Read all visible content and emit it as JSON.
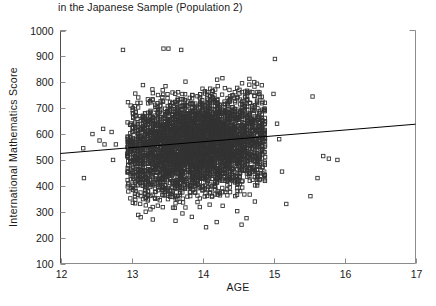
{
  "chart_data": {
    "type": "scatter",
    "title": "in the Japanese Sample (Population 2)",
    "xlabel": "AGE",
    "ylabel": "International Mathematics Score",
    "xlim": [
      12,
      17
    ],
    "ylim": [
      100,
      1000
    ],
    "xticks": [
      12,
      13,
      14,
      15,
      16,
      17
    ],
    "yticks": [
      100,
      200,
      300,
      400,
      500,
      600,
      700,
      800,
      900,
      1000
    ],
    "grid": false,
    "legend": null,
    "marker": "open-square",
    "marker_color": "#333333",
    "series": [
      {
        "name": "Students",
        "description": "Dense cluster of individual students aged about 13.0 to 14.9 with mathematics scores mostly between 250 and 900, plus sparse outliers at younger and older ages.",
        "n_points_approx": 3000,
        "cluster": {
          "x_range": [
            12.95,
            14.88
          ],
          "y_core_range": [
            280,
            880
          ],
          "y_full_range": [
            230,
            935
          ],
          "column_spacing": 0.035
        },
        "outliers": [
          {
            "x": 12.32,
            "y": 545
          },
          {
            "x": 12.33,
            "y": 430
          },
          {
            "x": 12.45,
            "y": 600
          },
          {
            "x": 12.55,
            "y": 575
          },
          {
            "x": 12.6,
            "y": 620
          },
          {
            "x": 12.62,
            "y": 560
          },
          {
            "x": 12.72,
            "y": 608
          },
          {
            "x": 12.74,
            "y": 500
          },
          {
            "x": 12.78,
            "y": 560
          },
          {
            "x": 12.88,
            "y": 925
          },
          {
            "x": 13.05,
            "y": 640
          },
          {
            "x": 13.15,
            "y": 455
          },
          {
            "x": 13.2,
            "y": 300
          },
          {
            "x": 13.3,
            "y": 270
          },
          {
            "x": 13.45,
            "y": 930
          },
          {
            "x": 13.52,
            "y": 930
          },
          {
            "x": 13.62,
            "y": 265
          },
          {
            "x": 13.7,
            "y": 925
          },
          {
            "x": 13.85,
            "y": 280
          },
          {
            "x": 14.05,
            "y": 240
          },
          {
            "x": 14.2,
            "y": 260
          },
          {
            "x": 14.55,
            "y": 250
          },
          {
            "x": 14.62,
            "y": 275
          },
          {
            "x": 15.02,
            "y": 890
          },
          {
            "x": 15.0,
            "y": 755
          },
          {
            "x": 15.05,
            "y": 640
          },
          {
            "x": 15.08,
            "y": 580
          },
          {
            "x": 15.12,
            "y": 455
          },
          {
            "x": 15.18,
            "y": 330
          },
          {
            "x": 15.55,
            "y": 745
          },
          {
            "x": 15.62,
            "y": 430
          },
          {
            "x": 15.7,
            "y": 515
          },
          {
            "x": 15.78,
            "y": 505
          },
          {
            "x": 15.9,
            "y": 500
          },
          {
            "x": 15.52,
            "y": 360
          }
        ]
      }
    ],
    "trendline": {
      "name": "regression-line",
      "x_start": 12,
      "y_start": 525,
      "x_end": 17,
      "y_end": 638,
      "color": "#000000"
    }
  },
  "colors": {
    "axis": "#4d4d4d",
    "text": "#1a1a1a",
    "marker_edge": "#333333",
    "trendline": "#000000",
    "background": "#ffffff"
  }
}
